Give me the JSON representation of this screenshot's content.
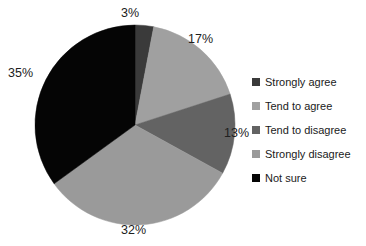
{
  "chart_data": {
    "type": "pie",
    "title": "",
    "categories": [
      "Strongly agree",
      "Tend to agree",
      "Tend to disagree",
      "Strongly disagree",
      "Not sure"
    ],
    "values": [
      3,
      17,
      13,
      32,
      35
    ],
    "value_labels": [
      "3%",
      "17%",
      "13%",
      "32%",
      "35%"
    ],
    "unit": "%",
    "colors": [
      "#3a3a3a",
      "#a0a0a0",
      "#636363",
      "#9a9a9a",
      "#050505"
    ],
    "start_angle_deg": 0,
    "direction": "clockwise",
    "legend_position": "right",
    "grid": false,
    "labels_outside": true
  },
  "legend": {
    "items": [
      {
        "label": "Strongly agree",
        "swatch": "#3a3a3a"
      },
      {
        "label": "Tend to agree",
        "swatch": "#a0a0a0"
      },
      {
        "label": "Tend to disagree",
        "swatch": "#636363"
      },
      {
        "label": "Strongly disagree",
        "swatch": "#9a9a9a"
      },
      {
        "label": "Not sure",
        "swatch": "#050505"
      }
    ]
  },
  "labels": {
    "p3": "3%",
    "p17": "17%",
    "p13": "13%",
    "p32": "32%",
    "p35": "35%"
  }
}
